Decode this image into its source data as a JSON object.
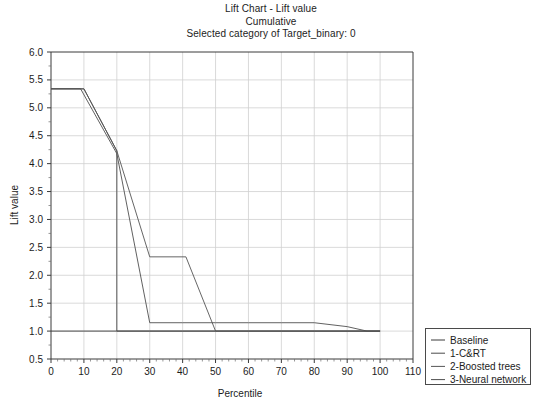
{
  "chart_data": {
    "type": "line",
    "title": "Lift Chart - Lift value",
    "subtitle": "Cumulative",
    "subtitle2": "Selected category of Target_binary: 0",
    "xlabel": "Percentile",
    "ylabel": "Lift value",
    "xlim": [
      0,
      110
    ],
    "ylim": [
      0.5,
      6.0
    ],
    "xticks": [
      0,
      10,
      20,
      30,
      40,
      50,
      60,
      70,
      80,
      90,
      100,
      110
    ],
    "xtick_labels": [
      "0",
      "10",
      "20",
      "30",
      "40",
      "50",
      "60",
      "70",
      "80",
      "90",
      "100",
      "110"
    ],
    "yticks": [
      0.5,
      1.0,
      1.5,
      2.0,
      2.5,
      3.0,
      3.5,
      4.0,
      4.5,
      5.0,
      5.5,
      6.0
    ],
    "ytick_labels": [
      "0.5",
      "1.0",
      "1.5",
      "2.0",
      "2.5",
      "3.0",
      "3.5",
      "4.0",
      "4.5",
      "5.0",
      "5.5",
      "6.0"
    ],
    "grid": true,
    "grid_color": "#d0d0d0",
    "legend_position": "right-outside",
    "series": [
      {
        "name": "Baseline",
        "color": "#3a3a3a",
        "x": [
          0,
          10,
          20,
          30,
          40,
          50,
          60,
          70,
          80,
          90,
          100
        ],
        "y": [
          1.0,
          1.0,
          1.0,
          1.0,
          1.0,
          1.0,
          1.0,
          1.0,
          1.0,
          1.0,
          1.0
        ]
      },
      {
        "name": "1-C&RT",
        "color": "#4a4a4a",
        "x": [
          0,
          10,
          20,
          20,
          30,
          40,
          50,
          60,
          70,
          80,
          90,
          100
        ],
        "y": [
          5.34,
          5.34,
          4.23,
          1.0,
          1.0,
          1.0,
          1.0,
          1.0,
          1.0,
          1.0,
          1.0,
          1.0
        ]
      },
      {
        "name": "2-Boosted trees",
        "color": "#555555",
        "x": [
          0,
          10,
          20,
          30,
          41,
          50,
          60,
          70,
          80,
          90,
          100
        ],
        "y": [
          5.34,
          5.34,
          4.23,
          2.33,
          2.33,
          1.0,
          1.0,
          1.0,
          1.0,
          1.0,
          1.0
        ]
      },
      {
        "name": "3-Neural network",
        "color": "#4f4f4f",
        "x": [
          0,
          9,
          20,
          30,
          40,
          50,
          60,
          70,
          80,
          90,
          96,
          100
        ],
        "y": [
          5.34,
          5.34,
          4.18,
          1.15,
          1.15,
          1.15,
          1.15,
          1.15,
          1.15,
          1.08,
          1.0,
          1.0
        ]
      }
    ]
  },
  "legend": {
    "items": [
      {
        "label": "Baseline"
      },
      {
        "label": "1-C&RT"
      },
      {
        "label": "2-Boosted trees"
      },
      {
        "label": "3-Neural network"
      }
    ]
  }
}
